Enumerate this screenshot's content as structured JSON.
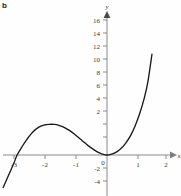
{
  "panel": {
    "label": "b"
  },
  "chart_data": {
    "type": "line",
    "title": "",
    "xlabel": "x",
    "ylabel": "y",
    "xlim": [
      -3.45,
      2.25
    ],
    "ylim": [
      -5.2,
      16.6
    ],
    "grid": false,
    "legend": null,
    "x_ticks": [
      -3,
      -2,
      -1,
      0,
      1,
      2
    ],
    "x_tick_labels": [
      "-3",
      "-2",
      "-1",
      "0",
      "1",
      "2"
    ],
    "y_ticks": [
      -4,
      -2,
      0,
      2,
      4,
      6,
      8,
      10,
      12,
      14,
      16
    ],
    "y_tick_labels": [
      "-4",
      "-2",
      "0",
      "2",
      "4",
      "6",
      "8",
      "10",
      "12",
      "14",
      "16"
    ],
    "curve_color": "#1a1a1a",
    "axis_color": "#8a8a8a",
    "annotations": [
      {
        "name": "local-maximum",
        "x": -1.7,
        "y": 4.7
      },
      {
        "name": "double-root-origin",
        "x": 0,
        "y": 0
      },
      {
        "name": "left-x-intercept",
        "x": -2.9,
        "y": 0
      }
    ],
    "series": [
      {
        "name": "cubic",
        "x": [
          -3.35,
          -3.2,
          -3.0,
          -2.9,
          -2.75,
          -2.6,
          -2.4,
          -2.2,
          -2.0,
          -1.85,
          -1.7,
          -1.55,
          -1.4,
          -1.2,
          -1.0,
          -0.8,
          -0.6,
          -0.45,
          -0.3,
          -0.15,
          0.0,
          0.15,
          0.3,
          0.45,
          0.6,
          0.75,
          0.9,
          1.05,
          1.2,
          1.32,
          1.45
        ],
        "y": [
          -5.0,
          -3.4,
          -1.2,
          0.0,
          1.2,
          2.3,
          3.5,
          4.3,
          4.65,
          4.72,
          4.7,
          4.55,
          4.3,
          3.75,
          3.0,
          2.2,
          1.4,
          0.9,
          0.45,
          0.15,
          0.0,
          0.15,
          0.45,
          1.0,
          1.8,
          2.9,
          4.4,
          6.3,
          8.7,
          11.3,
          15.5
        ]
      }
    ]
  },
  "axis_labels": {
    "x": "x",
    "y": "y"
  }
}
